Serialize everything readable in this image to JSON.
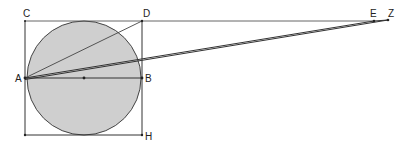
{
  "diagram": {
    "type": "geometry",
    "colors": {
      "circle_fill": "#cfcfcf",
      "circle_stroke": "#444444",
      "line": "#333333",
      "background": "#ffffff"
    },
    "points": {
      "C": {
        "label": "C",
        "x": 25,
        "y": 21
      },
      "D": {
        "label": "D",
        "x": 142,
        "y": 21
      },
      "A": {
        "label": "A",
        "x": 25,
        "y": 78
      },
      "B": {
        "label": "B",
        "x": 142,
        "y": 78
      },
      "H": {
        "label": "H",
        "x": 142,
        "y": 135
      },
      "BL": {
        "label": "",
        "x": 25,
        "y": 135
      },
      "O": {
        "label": "",
        "x": 84,
        "y": 78
      },
      "E": {
        "label": "E",
        "x": 374,
        "y": 21
      },
      "Z": {
        "label": "Z",
        "x": 388,
        "y": 20
      }
    },
    "labels": {
      "C": "C",
      "D": "D",
      "A": "A",
      "B": "B",
      "H": "H",
      "E": "E",
      "Z": "Z"
    },
    "circle": {
      "cx": 84,
      "cy": 78,
      "r": 57
    }
  }
}
